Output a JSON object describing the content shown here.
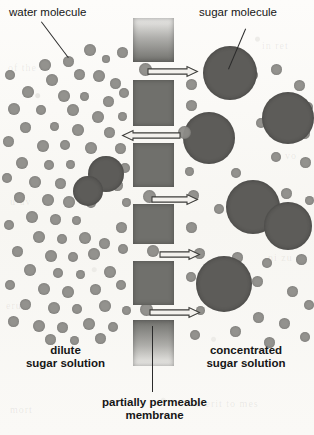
{
  "diagram": {
    "background_color": "#fbfaf8",
    "labels": {
      "water_molecule": "water molecule",
      "sugar_molecule": "sugar molecule",
      "dilute_line1": "dilute",
      "dilute_line2": "sugar solution",
      "concentrated_line1": "concentrated",
      "concentrated_line2": "sugar solution",
      "membrane_line1": "partially permeable",
      "membrane_line2": "membrane"
    },
    "colors": {
      "water_molecule": "#8e8d89",
      "sugar_molecule": "#5d5c59",
      "membrane": "#70706c",
      "text": "#161616",
      "leader_line": "#2b2b2b"
    },
    "membrane": {
      "pore_count": 5,
      "block_count": 6,
      "left_px": 133,
      "width_px": 41
    },
    "flow_arrows": [
      {
        "name": "arrow-1-rightward",
        "direction": "right",
        "x": 148,
        "y": 66,
        "length": 50
      },
      {
        "name": "arrow-2-leftward",
        "direction": "left",
        "x": 122,
        "y": 130,
        "length": 58
      },
      {
        "name": "arrow-3-rightward",
        "direction": "right",
        "x": 152,
        "y": 194,
        "length": 46
      },
      {
        "name": "arrow-4-rightward",
        "direction": "right",
        "x": 160,
        "y": 249,
        "length": 40
      },
      {
        "name": "arrow-5-rightward",
        "direction": "right",
        "x": 150,
        "y": 307,
        "length": 50
      }
    ],
    "ghost_text": [
      {
        "text": "of the",
        "x": 8,
        "y": 62,
        "size": 10
      },
      {
        "text": "in ret",
        "x": 262,
        "y": 40,
        "size": 10
      },
      {
        "text": "u uv",
        "x": 10,
        "y": 196,
        "size": 10
      },
      {
        "text": "a vo",
        "x": 276,
        "y": 150,
        "size": 10
      },
      {
        "text": "erut",
        "x": 6,
        "y": 300,
        "size": 10
      },
      {
        "text": "ni zu",
        "x": 268,
        "y": 252,
        "size": 10
      },
      {
        "text": "u erit to mes",
        "x": 196,
        "y": 398,
        "size": 10
      },
      {
        "text": "mort",
        "x": 10,
        "y": 404,
        "size": 10
      }
    ],
    "water_molecules_left": [
      {
        "x": 39,
        "y": 59,
        "d": 12
      },
      {
        "x": 84,
        "y": 44,
        "d": 12
      },
      {
        "x": 63,
        "y": 56,
        "d": 11
      },
      {
        "x": 102,
        "y": 55,
        "d": 8
      },
      {
        "x": 117,
        "y": 47,
        "d": 11
      },
      {
        "x": 5,
        "y": 70,
        "d": 10
      },
      {
        "x": 46,
        "y": 74,
        "d": 12
      },
      {
        "x": 74,
        "y": 69,
        "d": 11
      },
      {
        "x": 93,
        "y": 70,
        "d": 12
      },
      {
        "x": 110,
        "y": 78,
        "d": 11
      },
      {
        "x": 22,
        "y": 86,
        "d": 12
      },
      {
        "x": 58,
        "y": 90,
        "d": 12
      },
      {
        "x": 80,
        "y": 92,
        "d": 9
      },
      {
        "x": 103,
        "y": 96,
        "d": 11
      },
      {
        "x": 119,
        "y": 88,
        "d": 10
      },
      {
        "x": 8,
        "y": 103,
        "d": 12
      },
      {
        "x": 36,
        "y": 105,
        "d": 10
      },
      {
        "x": 67,
        "y": 104,
        "d": 12
      },
      {
        "x": 92,
        "y": 111,
        "d": 12
      },
      {
        "x": 118,
        "y": 112,
        "d": 9
      },
      {
        "x": 20,
        "y": 122,
        "d": 11
      },
      {
        "x": 50,
        "y": 122,
        "d": 9
      },
      {
        "x": 72,
        "y": 124,
        "d": 12
      },
      {
        "x": 104,
        "y": 127,
        "d": 11
      },
      {
        "x": 3,
        "y": 136,
        "d": 11
      },
      {
        "x": 37,
        "y": 140,
        "d": 12
      },
      {
        "x": 60,
        "y": 140,
        "d": 10
      },
      {
        "x": 85,
        "y": 142,
        "d": 12
      },
      {
        "x": 115,
        "y": 143,
        "d": 11
      },
      {
        "x": 16,
        "y": 157,
        "d": 12
      },
      {
        "x": 44,
        "y": 160,
        "d": 10
      },
      {
        "x": 66,
        "y": 160,
        "d": 9
      },
      {
        "x": 97,
        "y": 160,
        "d": 12
      },
      {
        "x": 120,
        "y": 163,
        "d": 10
      },
      {
        "x": 2,
        "y": 173,
        "d": 10
      },
      {
        "x": 29,
        "y": 176,
        "d": 12
      },
      {
        "x": 55,
        "y": 178,
        "d": 11
      },
      {
        "x": 78,
        "y": 180,
        "d": 9
      },
      {
        "x": 112,
        "y": 180,
        "d": 11
      },
      {
        "x": 14,
        "y": 192,
        "d": 11
      },
      {
        "x": 42,
        "y": 194,
        "d": 12
      },
      {
        "x": 63,
        "y": 196,
        "d": 12
      },
      {
        "x": 86,
        "y": 198,
        "d": 10
      },
      {
        "x": 122,
        "y": 198,
        "d": 9
      },
      {
        "x": 26,
        "y": 211,
        "d": 12
      },
      {
        "x": 50,
        "y": 214,
        "d": 11
      },
      {
        "x": 4,
        "y": 220,
        "d": 10
      },
      {
        "x": 72,
        "y": 216,
        "d": 9
      },
      {
        "x": 116,
        "y": 222,
        "d": 11
      },
      {
        "x": 33,
        "y": 231,
        "d": 12
      },
      {
        "x": 57,
        "y": 234,
        "d": 10
      },
      {
        "x": 79,
        "y": 232,
        "d": 12
      },
      {
        "x": 99,
        "y": 238,
        "d": 11
      },
      {
        "x": 12,
        "y": 246,
        "d": 11
      },
      {
        "x": 45,
        "y": 250,
        "d": 12
      },
      {
        "x": 68,
        "y": 252,
        "d": 10
      },
      {
        "x": 88,
        "y": 248,
        "d": 12
      },
      {
        "x": 118,
        "y": 244,
        "d": 10
      },
      {
        "x": 24,
        "y": 264,
        "d": 12
      },
      {
        "x": 53,
        "y": 268,
        "d": 10
      },
      {
        "x": 76,
        "y": 270,
        "d": 9
      },
      {
        "x": 104,
        "y": 266,
        "d": 12
      },
      {
        "x": 5,
        "y": 280,
        "d": 10
      },
      {
        "x": 38,
        "y": 283,
        "d": 12
      },
      {
        "x": 62,
        "y": 286,
        "d": 12
      },
      {
        "x": 90,
        "y": 284,
        "d": 11
      },
      {
        "x": 116,
        "y": 280,
        "d": 10
      },
      {
        "x": 20,
        "y": 299,
        "d": 11
      },
      {
        "x": 48,
        "y": 302,
        "d": 12
      },
      {
        "x": 72,
        "y": 304,
        "d": 10
      },
      {
        "x": 99,
        "y": 300,
        "d": 12
      },
      {
        "x": 122,
        "y": 306,
        "d": 9
      },
      {
        "x": 8,
        "y": 316,
        "d": 11
      },
      {
        "x": 33,
        "y": 320,
        "d": 12
      },
      {
        "x": 57,
        "y": 322,
        "d": 11
      },
      {
        "x": 83,
        "y": 318,
        "d": 12
      },
      {
        "x": 108,
        "y": 322,
        "d": 10
      },
      {
        "x": 45,
        "y": 334,
        "d": 11
      },
      {
        "x": 70,
        "y": 336,
        "d": 9
      },
      {
        "x": 95,
        "y": 333,
        "d": 11
      }
    ],
    "water_molecules_right": [
      {
        "x": 271,
        "y": 64,
        "d": 11
      },
      {
        "x": 186,
        "y": 79,
        "d": 11
      },
      {
        "x": 294,
        "y": 80,
        "d": 11
      },
      {
        "x": 248,
        "y": 70,
        "d": 10
      },
      {
        "x": 186,
        "y": 100,
        "d": 11
      },
      {
        "x": 276,
        "y": 97,
        "d": 11
      },
      {
        "x": 303,
        "y": 102,
        "d": 10
      },
      {
        "x": 189,
        "y": 124,
        "d": 11
      },
      {
        "x": 256,
        "y": 118,
        "d": 10
      },
      {
        "x": 299,
        "y": 128,
        "d": 11
      },
      {
        "x": 206,
        "y": 146,
        "d": 11
      },
      {
        "x": 271,
        "y": 152,
        "d": 10
      },
      {
        "x": 300,
        "y": 157,
        "d": 11
      },
      {
        "x": 185,
        "y": 167,
        "d": 9
      },
      {
        "x": 231,
        "y": 168,
        "d": 10
      },
      {
        "x": 188,
        "y": 190,
        "d": 11
      },
      {
        "x": 281,
        "y": 188,
        "d": 11
      },
      {
        "x": 251,
        "y": 196,
        "d": 10
      },
      {
        "x": 305,
        "y": 196,
        "d": 9
      },
      {
        "x": 214,
        "y": 204,
        "d": 10
      },
      {
        "x": 186,
        "y": 222,
        "d": 11
      },
      {
        "x": 300,
        "y": 224,
        "d": 11
      },
      {
        "x": 270,
        "y": 230,
        "d": 10
      },
      {
        "x": 194,
        "y": 248,
        "d": 11
      },
      {
        "x": 232,
        "y": 252,
        "d": 11
      },
      {
        "x": 262,
        "y": 258,
        "d": 10
      },
      {
        "x": 296,
        "y": 254,
        "d": 11
      },
      {
        "x": 186,
        "y": 272,
        "d": 10
      },
      {
        "x": 252,
        "y": 276,
        "d": 11
      },
      {
        "x": 226,
        "y": 292,
        "d": 10
      },
      {
        "x": 287,
        "y": 286,
        "d": 11
      },
      {
        "x": 304,
        "y": 300,
        "d": 10
      },
      {
        "x": 196,
        "y": 306,
        "d": 9
      },
      {
        "x": 253,
        "y": 312,
        "d": 11
      },
      {
        "x": 279,
        "y": 318,
        "d": 11
      },
      {
        "x": 230,
        "y": 326,
        "d": 11
      },
      {
        "x": 300,
        "y": 332,
        "d": 10
      },
      {
        "x": 190,
        "y": 330,
        "d": 10
      },
      {
        "x": 264,
        "y": 337,
        "d": 11
      }
    ],
    "water_molecules_membrane": [
      {
        "x": 139,
        "y": 63,
        "d": 13
      },
      {
        "x": 178,
        "y": 126,
        "d": 13
      },
      {
        "x": 143,
        "y": 190,
        "d": 13
      },
      {
        "x": 147,
        "y": 245,
        "d": 12
      },
      {
        "x": 140,
        "y": 303,
        "d": 13
      }
    ],
    "sugar_molecules": [
      {
        "x": 203,
        "y": 46,
        "d": 54
      },
      {
        "x": 262,
        "y": 92,
        "d": 52
      },
      {
        "x": 183,
        "y": 112,
        "d": 52
      },
      {
        "x": 226,
        "y": 180,
        "d": 54
      },
      {
        "x": 264,
        "y": 202,
        "d": 48
      },
      {
        "x": 196,
        "y": 256,
        "d": 56
      },
      {
        "x": 88,
        "y": 156,
        "d": 36
      },
      {
        "x": 73,
        "y": 176,
        "d": 30
      }
    ]
  }
}
